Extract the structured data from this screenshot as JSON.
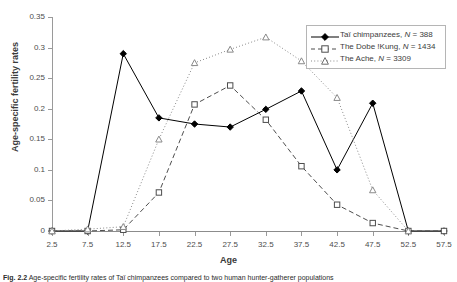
{
  "chart_data": {
    "type": "line",
    "title": "",
    "xlabel": "Age",
    "ylabel": "Age-specific fertility rates",
    "x": [
      2.5,
      7.5,
      12.5,
      17.5,
      22.5,
      27.5,
      32.5,
      37.5,
      42.5,
      47.5,
      52.5,
      57.5
    ],
    "xticklabels": [
      "2.5",
      "7.5",
      "12.5",
      "17.5",
      "22.5",
      "27.5",
      "32.5",
      "37.5",
      "42.5",
      "47.5",
      "52.5",
      "57.5"
    ],
    "yticklabels": [
      "0",
      "0.05",
      "0.1",
      "0.15",
      "0.2",
      "0.25",
      "0.3",
      "0.35"
    ],
    "yticks": [
      0,
      0.05,
      0.1,
      0.15,
      0.2,
      0.25,
      0.3,
      0.35
    ],
    "xlim": [
      2.5,
      57.5
    ],
    "ylim": [
      0,
      0.35
    ],
    "grid": false,
    "legend_position": "top-right",
    "series": [
      {
        "name": "Tai chimpanzees, N = 388",
        "label_text": "Taï chimpanzees, ",
        "label_italic": "N",
        "label_tail": " = 388",
        "marker": "filled-diamond",
        "linestyle": "solid",
        "color": "#000000",
        "values": [
          0,
          0,
          0.29,
          0.185,
          0.175,
          0.17,
          0.199,
          0.229,
          0.1,
          0.209,
          0,
          0
        ]
      },
      {
        "name": "The Dobe !Kung, N = 1434",
        "label_text": "The Dobe !Kung, ",
        "label_italic": "N",
        "label_tail": " = 1434",
        "marker": "open-square",
        "linestyle": "dashed",
        "color": "#4d4d4d",
        "values": [
          0,
          0,
          0.002,
          0.063,
          0.207,
          0.238,
          0.182,
          0.106,
          0.043,
          0.013,
          0,
          0
        ]
      },
      {
        "name": "The Ache, N = 3309",
        "label_text": "The Ache, ",
        "label_italic": "N",
        "label_tail": " = 3309",
        "marker": "open-triangle",
        "linestyle": "dotted",
        "color": "#8a8a8a",
        "values": [
          0,
          0.003,
          0.007,
          0.15,
          0.275,
          0.297,
          0.317,
          0.278,
          0.218,
          0.067,
          0,
          null
        ]
      }
    ]
  },
  "legend": {
    "rows": [
      "Taï chimpanzees, N = 388",
      "The Dobe !Kung, N = 1434",
      "The Ache, N = 3309"
    ]
  },
  "caption": {
    "figure_number": "Fig. 2.2",
    "text": "Age-specific fertility rates of Taï chimpanzees compared to two human hunter-gatherer populations"
  }
}
